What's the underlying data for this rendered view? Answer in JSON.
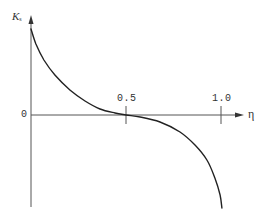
{
  "chart_data": {
    "type": "line",
    "title": "",
    "xlabel": "η",
    "ylabel": "K_s",
    "ylabel_main": "K",
    "ylabel_sub": "s",
    "x_ticks": [
      {
        "value": 0.5,
        "label": "0.5"
      },
      {
        "value": 1.0,
        "label": "1.0"
      }
    ],
    "y_ticks": [
      {
        "value": 0,
        "label": "0"
      }
    ],
    "origin_label": "0",
    "xlim": [
      0,
      1.1
    ],
    "ylim": [
      -1.08,
      1.0
    ],
    "grid": false,
    "legend": null,
    "series": [
      {
        "name": "K_s(η)",
        "color": "#222222",
        "x": [
          0.0,
          0.026,
          0.068,
          0.126,
          0.205,
          0.284,
          0.363,
          0.442,
          0.5,
          0.574,
          0.679,
          0.784,
          0.863,
          0.926,
          0.968,
          0.995,
          1.005
        ],
        "y": [
          1.0,
          0.826,
          0.64,
          0.465,
          0.291,
          0.163,
          0.07,
          0.023,
          0.0,
          -0.023,
          -0.081,
          -0.198,
          -0.349,
          -0.523,
          -0.733,
          -0.93,
          -1.081
        ]
      }
    ],
    "annotations": []
  },
  "labels": {
    "tick_05": "0.5",
    "tick_10": "1.0",
    "origin": "0",
    "x_axis": "η",
    "y_axis_main": "K",
    "y_axis_sub": "s"
  }
}
